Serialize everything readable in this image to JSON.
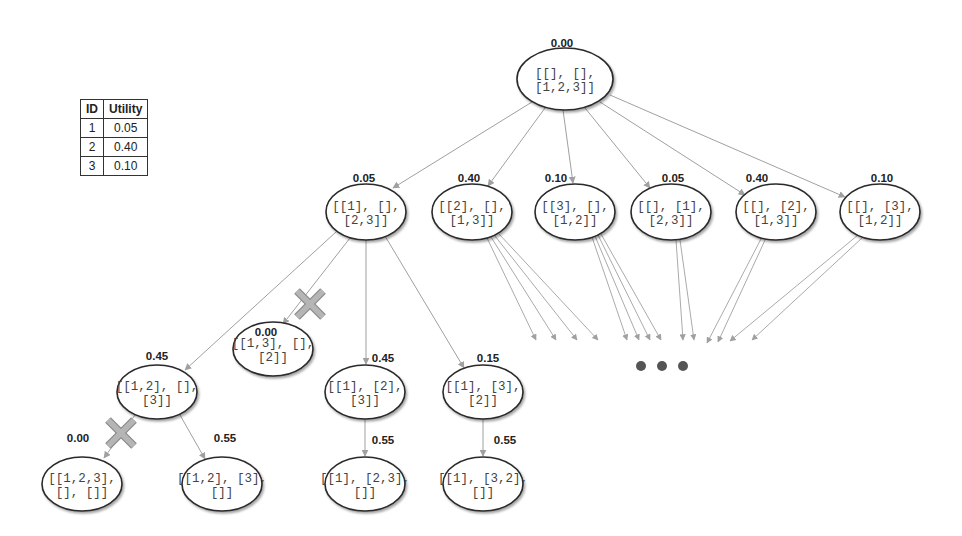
{
  "utility_table": {
    "headers": [
      "ID",
      "Utility"
    ],
    "rows": [
      {
        "id": "1",
        "utility": "0.05"
      },
      {
        "id": "2",
        "utility": "0.40"
      },
      {
        "id": "3",
        "utility": "0.10"
      }
    ]
  },
  "colors": {
    "edge": "#a0a0a0",
    "node_stroke": "#2a2a2a",
    "pruned_mark": "#b5b5b5",
    "ellipsis_dot": "#555555"
  },
  "tree": {
    "nodes": [
      {
        "id": "root",
        "line1": "[[], [],",
        "line2": "[1,2,3]]",
        "score": "0.00",
        "cx": 565,
        "cy": 79,
        "rx": 48,
        "ry": 31,
        "sx": 562,
        "sy": 47
      },
      {
        "id": "n1",
        "line1": "[[1], [],",
        "line2": "[2,3]]",
        "score": "0.05",
        "cx": 366,
        "cy": 212,
        "rx": 40,
        "ry": 28,
        "sx": 364,
        "sy": 182
      },
      {
        "id": "n2",
        "line1": "[[2], [],",
        "line2": "[1,3]]",
        "score": "0.40",
        "cx": 472,
        "cy": 212,
        "rx": 40,
        "ry": 28,
        "sx": 469,
        "sy": 182
      },
      {
        "id": "n3",
        "line1": "[[3], [],",
        "line2": "[1,2]]",
        "score": "0.10",
        "cx": 575,
        "cy": 212,
        "rx": 40,
        "ry": 28,
        "sx": 556,
        "sy": 182
      },
      {
        "id": "n4",
        "line1": "[[], [1],",
        "line2": "[2,3]]",
        "score": "0.05",
        "cx": 671,
        "cy": 212,
        "rx": 40,
        "ry": 28,
        "sx": 673,
        "sy": 182
      },
      {
        "id": "n5",
        "line1": "[[], [2],",
        "line2": "[1,3]]",
        "score": "0.40",
        "cx": 776,
        "cy": 212,
        "rx": 40,
        "ry": 28,
        "sx": 757,
        "sy": 182
      },
      {
        "id": "n6",
        "line1": "[[], [3],",
        "line2": "[1,2]]",
        "score": "0.10",
        "cx": 880,
        "cy": 212,
        "rx": 40,
        "ry": 28,
        "sx": 882,
        "sy": 182
      },
      {
        "id": "n11",
        "line1": "[[1,2], [],",
        "line2": "[3]]",
        "score": "0.45",
        "cx": 157,
        "cy": 392,
        "rx": 40,
        "ry": 27,
        "sx": 157,
        "sy": 360
      },
      {
        "id": "n12",
        "line1": "[[1,3], [],",
        "line2": "[2]]",
        "score": "0.00",
        "cx": 273,
        "cy": 349,
        "rx": 40,
        "ry": 27,
        "sx": 266,
        "sy": 336
      },
      {
        "id": "n13",
        "line1": "[[1], [2],",
        "line2": "[3]]",
        "score": "0.45",
        "cx": 365,
        "cy": 392,
        "rx": 40,
        "ry": 27,
        "sx": 383,
        "sy": 362
      },
      {
        "id": "n14",
        "line1": "[[1], [3],",
        "line2": "[2]]",
        "score": "0.15",
        "cx": 483,
        "cy": 392,
        "rx": 40,
        "ry": 27,
        "sx": 488,
        "sy": 362
      },
      {
        "id": "n111",
        "line1": "[[1,2,3],",
        "line2": "[], []]",
        "score": "0.00",
        "cx": 82,
        "cy": 484,
        "rx": 40,
        "ry": 27,
        "sx": 78,
        "sy": 442
      },
      {
        "id": "n112",
        "line1": "[[1,2], [3],",
        "line2": "[]]",
        "score": "0.55",
        "cx": 222,
        "cy": 484,
        "rx": 40,
        "ry": 27,
        "sx": 225,
        "sy": 442
      },
      {
        "id": "n131",
        "line1": "[[1], [2,3],",
        "line2": "[]]",
        "score": "0.55",
        "cx": 365,
        "cy": 484,
        "rx": 40,
        "ry": 27,
        "sx": 383,
        "sy": 444
      },
      {
        "id": "n141",
        "line1": "[[1], [3,2],",
        "line2": "[]]",
        "score": "0.55",
        "cx": 483,
        "cy": 484,
        "rx": 40,
        "ry": 27,
        "sx": 505,
        "sy": 444
      }
    ],
    "edges": [
      {
        "x1": 532,
        "y1": 102,
        "x2": 393,
        "y2": 188
      },
      {
        "x1": 545,
        "y1": 108,
        "x2": 488,
        "y2": 186
      },
      {
        "x1": 563,
        "y1": 110,
        "x2": 573,
        "y2": 183
      },
      {
        "x1": 585,
        "y1": 108,
        "x2": 650,
        "y2": 188
      },
      {
        "x1": 600,
        "y1": 102,
        "x2": 745,
        "y2": 195
      },
      {
        "x1": 610,
        "y1": 95,
        "x2": 845,
        "y2": 197
      },
      {
        "x1": 336,
        "y1": 232,
        "x2": 185,
        "y2": 370
      },
      {
        "x1": 350,
        "y1": 238,
        "x2": 283,
        "y2": 324
      },
      {
        "x1": 366,
        "y1": 240,
        "x2": 366,
        "y2": 364
      },
      {
        "x1": 385,
        "y1": 236,
        "x2": 464,
        "y2": 368
      },
      {
        "x1": 135,
        "y1": 415,
        "x2": 104,
        "y2": 458
      },
      {
        "x1": 180,
        "y1": 415,
        "x2": 205,
        "y2": 459
      },
      {
        "x1": 365,
        "y1": 419,
        "x2": 365,
        "y2": 456
      },
      {
        "x1": 483,
        "y1": 419,
        "x2": 483,
        "y2": 456
      }
    ],
    "fan_edges": [
      {
        "x1": 487,
        "y1": 238,
        "x2": 536,
        "y2": 340
      },
      {
        "x1": 491,
        "y1": 237,
        "x2": 556,
        "y2": 340
      },
      {
        "x1": 495,
        "y1": 236,
        "x2": 577,
        "y2": 340
      },
      {
        "x1": 499,
        "y1": 234,
        "x2": 598,
        "y2": 340
      },
      {
        "x1": 592,
        "y1": 237,
        "x2": 627,
        "y2": 340
      },
      {
        "x1": 595,
        "y1": 236,
        "x2": 639,
        "y2": 340
      },
      {
        "x1": 598,
        "y1": 235,
        "x2": 650,
        "y2": 340
      },
      {
        "x1": 601,
        "y1": 234,
        "x2": 661,
        "y2": 340
      },
      {
        "x1": 676,
        "y1": 240,
        "x2": 683,
        "y2": 340
      },
      {
        "x1": 680,
        "y1": 240,
        "x2": 694,
        "y2": 340
      },
      {
        "x1": 762,
        "y1": 237,
        "x2": 707,
        "y2": 343
      },
      {
        "x1": 766,
        "y1": 238,
        "x2": 718,
        "y2": 342
      },
      {
        "x1": 858,
        "y1": 235,
        "x2": 730,
        "y2": 341
      },
      {
        "x1": 862,
        "y1": 238,
        "x2": 752,
        "y2": 340
      }
    ],
    "pruned_marks": [
      {
        "cx": 310,
        "cy": 304,
        "size": 13
      },
      {
        "cx": 121,
        "cy": 433,
        "size": 13
      }
    ],
    "ellipsis_dots": [
      {
        "cx": 641,
        "cy": 366,
        "r": 5
      },
      {
        "cx": 662,
        "cy": 366,
        "r": 5
      },
      {
        "cx": 683,
        "cy": 366,
        "r": 5
      }
    ]
  }
}
